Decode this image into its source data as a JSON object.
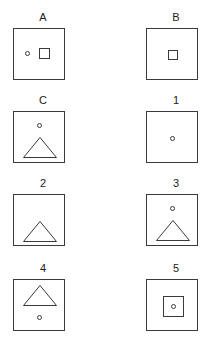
{
  "figure": {
    "type": "visual-analogy-puzzle",
    "background_color": "#ffffff",
    "stroke_color": "#3a3a3a",
    "label_color": "#1a1a1a",
    "rows": 4,
    "columns": 2
  },
  "panels": [
    {
      "label": "A",
      "row": 1,
      "column": "left",
      "shapes": [
        {
          "kind": "circle",
          "x": 11,
          "y": 22,
          "w": 5,
          "h": 5
        },
        {
          "kind": "square",
          "x": 25,
          "y": 19,
          "w": 11,
          "h": 11
        }
      ]
    },
    {
      "label": "B",
      "row": 1,
      "column": "right",
      "shapes": [
        {
          "kind": "square",
          "x": 21,
          "y": 21,
          "w": 10,
          "h": 10
        }
      ]
    },
    {
      "label": "C",
      "row": 2,
      "column": "left",
      "shapes": [
        {
          "kind": "circle",
          "x": 23,
          "y": 11,
          "w": 5,
          "h": 5
        },
        {
          "kind": "triangle",
          "x": 9,
          "y": 25,
          "w": 34,
          "h": 21
        }
      ]
    },
    {
      "label": "1",
      "row": 2,
      "column": "right",
      "shapes": [
        {
          "kind": "circle",
          "x": 23,
          "y": 24,
          "w": 5,
          "h": 5
        }
      ]
    },
    {
      "label": "2",
      "row": 3,
      "column": "left",
      "shapes": [
        {
          "kind": "triangle",
          "x": 9,
          "y": 26,
          "w": 34,
          "h": 21
        }
      ]
    },
    {
      "label": "3",
      "row": 3,
      "column": "right",
      "shapes": [
        {
          "kind": "circle",
          "x": 23,
          "y": 11,
          "w": 5,
          "h": 5
        },
        {
          "kind": "triangle",
          "x": 9,
          "y": 25,
          "w": 34,
          "h": 21
        }
      ]
    },
    {
      "label": "4",
      "row": 4,
      "column": "left",
      "shapes": [
        {
          "kind": "triangle",
          "x": 9,
          "y": 5,
          "w": 34,
          "h": 21
        },
        {
          "kind": "circle",
          "x": 23,
          "y": 35,
          "w": 5,
          "h": 5
        }
      ]
    },
    {
      "label": "5",
      "row": 4,
      "column": "right",
      "shapes": [
        {
          "kind": "square",
          "x": 16,
          "y": 16,
          "w": 21,
          "h": 21
        },
        {
          "kind": "circle",
          "x": 24,
          "y": 24,
          "w": 5,
          "h": 5
        }
      ]
    }
  ]
}
